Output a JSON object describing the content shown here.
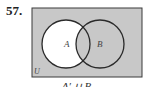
{
  "problem": {
    "number": "57.",
    "caption": "A′ ∪ B"
  },
  "diagram": {
    "universe_label": "U",
    "sets": [
      {
        "label": "A",
        "cx": 66,
        "cy": 44,
        "r": 24
      },
      {
        "label": "B",
        "cx": 100,
        "cy": 44,
        "r": 24
      }
    ],
    "shaded_color": "#c8c8c8",
    "unshaded_color": "#ffffff",
    "stroke_color": "#2a2a2a",
    "unshaded_region": "A only"
  }
}
